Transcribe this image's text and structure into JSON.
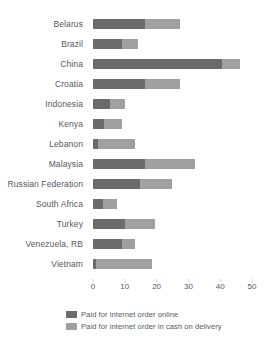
{
  "header": {
    "clipped_text": ""
  },
  "legend": {
    "position": "bottom",
    "items": [
      {
        "label": "Paid for internet order online",
        "color": "#6b6b6b",
        "swatch_name": "legend-swatch-online"
      },
      {
        "label": "Paid for internet order in cash on delivery",
        "color": "#a0a0a0",
        "swatch_name": "legend-swatch-cash"
      }
    ]
  },
  "axis": {
    "ticks": [
      "0",
      "10",
      "20",
      "30",
      "40",
      "50"
    ]
  },
  "chart_data": {
    "type": "bar",
    "orientation": "horizontal",
    "stacked": true,
    "title": "",
    "xlabel": "",
    "ylabel": "",
    "xlim": [
      0,
      50
    ],
    "xticks": [
      0,
      10,
      20,
      30,
      40,
      50
    ],
    "grid": false,
    "legend_position": "bottom",
    "categories": [
      "Belarus",
      "Brazil",
      "China",
      "Croatia",
      "Indonesia",
      "Kenya",
      "Lebanon",
      "Malaysia",
      "Russian Federation",
      "South Africa",
      "Turkey",
      "Venezuela, RB",
      "Vietnam"
    ],
    "series": [
      {
        "name": "Paid for internet order online",
        "color": "#6b6b6b",
        "values": [
          16.4,
          9.1,
          40.5,
          16.4,
          5.3,
          3.5,
          1.5,
          16.4,
          14.8,
          3.2,
          10.1,
          9.1,
          1.0
        ]
      },
      {
        "name": "Paid for internet order in cash on delivery",
        "color": "#a0a0a0",
        "values": [
          11.0,
          5.1,
          5.7,
          11.0,
          4.8,
          5.6,
          11.7,
          15.7,
          10.0,
          4.3,
          9.4,
          4.1,
          17.5
        ]
      }
    ],
    "totals": [
      27.4,
      14.2,
      46.2,
      27.4,
      10.1,
      9.1,
      13.2,
      32.1,
      24.8,
      7.5,
      19.5,
      13.2,
      18.5
    ]
  }
}
